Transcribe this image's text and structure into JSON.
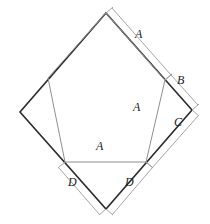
{
  "figure": {
    "type": "geometry-diagram",
    "colors": {
      "square_stroke": "#2b2b2b",
      "pentagon_stroke": "#8c8c8c",
      "dimension_stroke": "#9a9a9a",
      "label_color": "#1a1a1a",
      "background": "#ffffff"
    },
    "square": {
      "name": "outer-square",
      "vertices": [
        {
          "name": "top",
          "x": 106,
          "y": 13
        },
        {
          "name": "right",
          "x": 192,
          "y": 110
        },
        {
          "name": "bottom",
          "x": 106,
          "y": 209
        },
        {
          "name": "left",
          "x": 20,
          "y": 112
        }
      ]
    },
    "pentagon": {
      "name": "inner-pentagon",
      "vertices": [
        {
          "name": "apex",
          "x": 106,
          "y": 13
        },
        {
          "name": "upper-right",
          "x": 165,
          "y": 80
        },
        {
          "name": "lower-right",
          "x": 146,
          "y": 162
        },
        {
          "name": "lower-left",
          "x": 65,
          "y": 162
        },
        {
          "name": "upper-left",
          "x": 48,
          "y": 78
        }
      ]
    },
    "labels": [
      {
        "id": "a-top-right",
        "text": "A",
        "x": 138,
        "y": 34
      },
      {
        "id": "b-right",
        "text": "B",
        "x": 179,
        "y": 80
      },
      {
        "id": "c-right",
        "text": "C",
        "x": 176,
        "y": 122
      },
      {
        "id": "a-diagonal",
        "text": "A",
        "x": 136,
        "y": 107
      },
      {
        "id": "a-horizontal",
        "text": "A",
        "x": 99,
        "y": 146
      },
      {
        "id": "d-left",
        "text": "D",
        "x": 71,
        "y": 182
      },
      {
        "id": "d-right",
        "text": "D",
        "x": 128,
        "y": 182
      }
    ],
    "dimension_segments": [
      {
        "id": "dim-A-top",
        "label": "A",
        "from": {
          "x": 106,
          "y": 13
        },
        "to": {
          "x": 165,
          "y": 80
        }
      },
      {
        "id": "dim-B-right",
        "label": "B",
        "from": {
          "x": 165,
          "y": 80
        },
        "to": {
          "x": 192,
          "y": 110
        }
      },
      {
        "id": "dim-C-right",
        "label": "C",
        "from": {
          "x": 192,
          "y": 110
        },
        "to": {
          "x": 146,
          "y": 162
        }
      },
      {
        "id": "dim-D-right",
        "label": "D",
        "from": {
          "x": 146,
          "y": 162
        },
        "to": {
          "x": 106,
          "y": 209
        }
      },
      {
        "id": "dim-D-left",
        "label": "D",
        "from": {
          "x": 106,
          "y": 209
        },
        "to": {
          "x": 65,
          "y": 162
        }
      }
    ]
  }
}
